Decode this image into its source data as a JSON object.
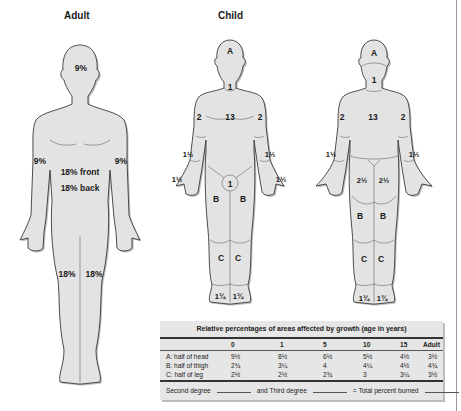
{
  "titles": {
    "adult": "Adult",
    "child": "Child"
  },
  "adult": {
    "labels": {
      "head": "9%",
      "left_arm": "9%",
      "right_arm": "9%",
      "trunk_front": "18% front",
      "trunk_back": "18% back",
      "left_leg": "18%",
      "right_leg": "18%"
    }
  },
  "child_front": {
    "labels": {
      "head": "A",
      "neck": "1",
      "trunk": "13",
      "upper_arm_left": "2",
      "upper_arm_right": "2",
      "forearm_left": "1½",
      "forearm_right": "1½",
      "hand_left": "1½",
      "hand_right": "1½",
      "genitalia": "1",
      "thigh_left": "B",
      "thigh_right": "B",
      "leg_left": "C",
      "leg_right": "C",
      "foot_left": "1¾",
      "foot_right": "1¾"
    }
  },
  "child_back": {
    "labels": {
      "head": "A",
      "neck": "1",
      "trunk": "13",
      "upper_arm_left": "2",
      "upper_arm_right": "2",
      "forearm_left": "1½",
      "forearm_right": "1½",
      "buttock_left": "2½",
      "buttock_right": "2½",
      "thigh_left": "B",
      "thigh_right": "B",
      "leg_left": "C",
      "leg_right": "C",
      "foot_left": "1¾",
      "foot_right": "1¾"
    }
  },
  "table": {
    "title": "Relative percentages of areas affected by growth (age in years)",
    "columns": [
      "",
      "0",
      "1",
      "5",
      "10",
      "15",
      "Adult"
    ],
    "rows": [
      {
        "label": "A:  half of head",
        "values": [
          "9½",
          "8½",
          "6½",
          "5½",
          "4½",
          "3½"
        ]
      },
      {
        "label": "B:  half of thigh",
        "values": [
          "2¾",
          "3¼",
          "4",
          "4¼",
          "4½",
          "4¾"
        ]
      },
      {
        "label": "C:  half of leg",
        "values": [
          "2½",
          "2½",
          "2¾",
          "3",
          "3¼",
          "3½"
        ]
      }
    ],
    "footer": {
      "second_degree": "Second degree",
      "third_degree": "and Third degree",
      "total": "= Total percent burned"
    }
  }
}
